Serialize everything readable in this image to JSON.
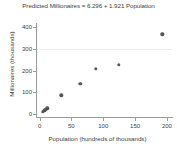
{
  "chart_data": {
    "type": "scatter",
    "title": "Predicted Millionaires = 6.296 + 1.921 Population",
    "xlabel": "Population (hundreds of thousands)",
    "ylabel": "Millionaires (thousands)",
    "xlim": [
      -4,
      208
    ],
    "ylim": [
      -14,
      410
    ],
    "xticks": [
      0,
      50,
      100,
      150,
      200
    ],
    "yticks": [
      0,
      100,
      200,
      300,
      400
    ],
    "grid": "horizontal-faint",
    "gridlines_y": [
      300
    ],
    "legend": null,
    "marker_color": "#555555",
    "axis_color": "#9b9b9b",
    "background_color": "#ffffff",
    "regression": {
      "intercept": 6.296,
      "slope": 1.921,
      "equation": "Predicted Millionaires = 6.296 + 1.921 Population",
      "line_drawn": false
    },
    "points": [
      {
        "x": 5,
        "y": 10
      },
      {
        "x": 7,
        "y": 14
      },
      {
        "x": 8,
        "y": 17
      },
      {
        "x": 9,
        "y": 20
      },
      {
        "x": 11,
        "y": 24
      },
      {
        "x": 12,
        "y": 26
      },
      {
        "x": 34,
        "y": 86
      },
      {
        "x": 64,
        "y": 140
      },
      {
        "x": 88,
        "y": 208
      },
      {
        "x": 124,
        "y": 227
      },
      {
        "x": 193,
        "y": 368
      }
    ]
  }
}
